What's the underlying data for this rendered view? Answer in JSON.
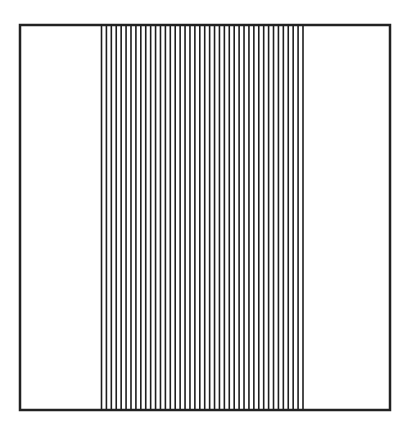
{
  "figure": {
    "frame": {
      "x": 20,
      "y": 25,
      "width": 370,
      "height": 385,
      "stroke": "#222222",
      "stroke_width": 2.5
    },
    "stripes": {
      "count": 42,
      "x_start": 101.5,
      "x_end": 303,
      "stroke": "#1e1e1e",
      "stroke_width": 1.6
    }
  }
}
